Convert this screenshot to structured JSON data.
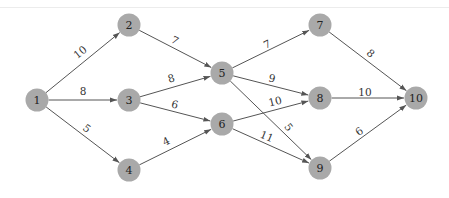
{
  "diagram": {
    "type": "directed-network",
    "node_color": "#a9a9a9",
    "edge_color": "#555555",
    "nodes": [
      {
        "id": "1",
        "label": "1",
        "x": 37,
        "y": 100
      },
      {
        "id": "2",
        "label": "2",
        "x": 129,
        "y": 25
      },
      {
        "id": "3",
        "label": "3",
        "x": 129,
        "y": 100
      },
      {
        "id": "4",
        "label": "4",
        "x": 129,
        "y": 170
      },
      {
        "id": "5",
        "label": "5",
        "x": 222,
        "y": 73
      },
      {
        "id": "6",
        "label": "6",
        "x": 222,
        "y": 124
      },
      {
        "id": "7",
        "label": "7",
        "x": 320,
        "y": 25
      },
      {
        "id": "8",
        "label": "8",
        "x": 320,
        "y": 98
      },
      {
        "id": "9",
        "label": "9",
        "x": 320,
        "y": 168
      },
      {
        "id": "10",
        "label": "10",
        "x": 416,
        "y": 98
      }
    ],
    "edges": [
      {
        "from": "1",
        "to": "2",
        "weight": "10",
        "lx": 80,
        "ly": 52,
        "rot": -39
      },
      {
        "from": "1",
        "to": "3",
        "weight": "8",
        "lx": 83,
        "ly": 91,
        "rot": 0
      },
      {
        "from": "1",
        "to": "4",
        "weight": "5",
        "lx": 87,
        "ly": 128,
        "rot": 37
      },
      {
        "from": "2",
        "to": "5",
        "weight": "7",
        "lx": 175,
        "ly": 40,
        "rot": 28
      },
      {
        "from": "3",
        "to": "5",
        "weight": "8",
        "lx": 171,
        "ly": 78,
        "rot": -16
      },
      {
        "from": "3",
        "to": "6",
        "weight": "6",
        "lx": 175,
        "ly": 104,
        "rot": 13
      },
      {
        "from": "4",
        "to": "6",
        "weight": "4",
        "lx": 166,
        "ly": 141,
        "rot": -26
      },
      {
        "from": "5",
        "to": "7",
        "weight": "7",
        "lx": 267,
        "ly": 44,
        "rot": -24
      },
      {
        "from": "5",
        "to": "8",
        "weight": "9",
        "lx": 272,
        "ly": 78,
        "rot": 12
      },
      {
        "from": "5",
        "to": "9",
        "weight": "5",
        "lx": 289,
        "ly": 127,
        "rot": 52
      },
      {
        "from": "6",
        "to": "8",
        "weight": "10",
        "lx": 275,
        "ly": 101,
        "rot": -14
      },
      {
        "from": "6",
        "to": "9",
        "weight": "11",
        "lx": 267,
        "ly": 136,
        "rot": 22
      },
      {
        "from": "7",
        "to": "10",
        "weight": "8",
        "lx": 371,
        "ly": 53,
        "rot": 40
      },
      {
        "from": "8",
        "to": "10",
        "weight": "10",
        "lx": 365,
        "ly": 92,
        "rot": 0
      },
      {
        "from": "9",
        "to": "10",
        "weight": "6",
        "lx": 359,
        "ly": 131,
        "rot": -37
      }
    ]
  }
}
